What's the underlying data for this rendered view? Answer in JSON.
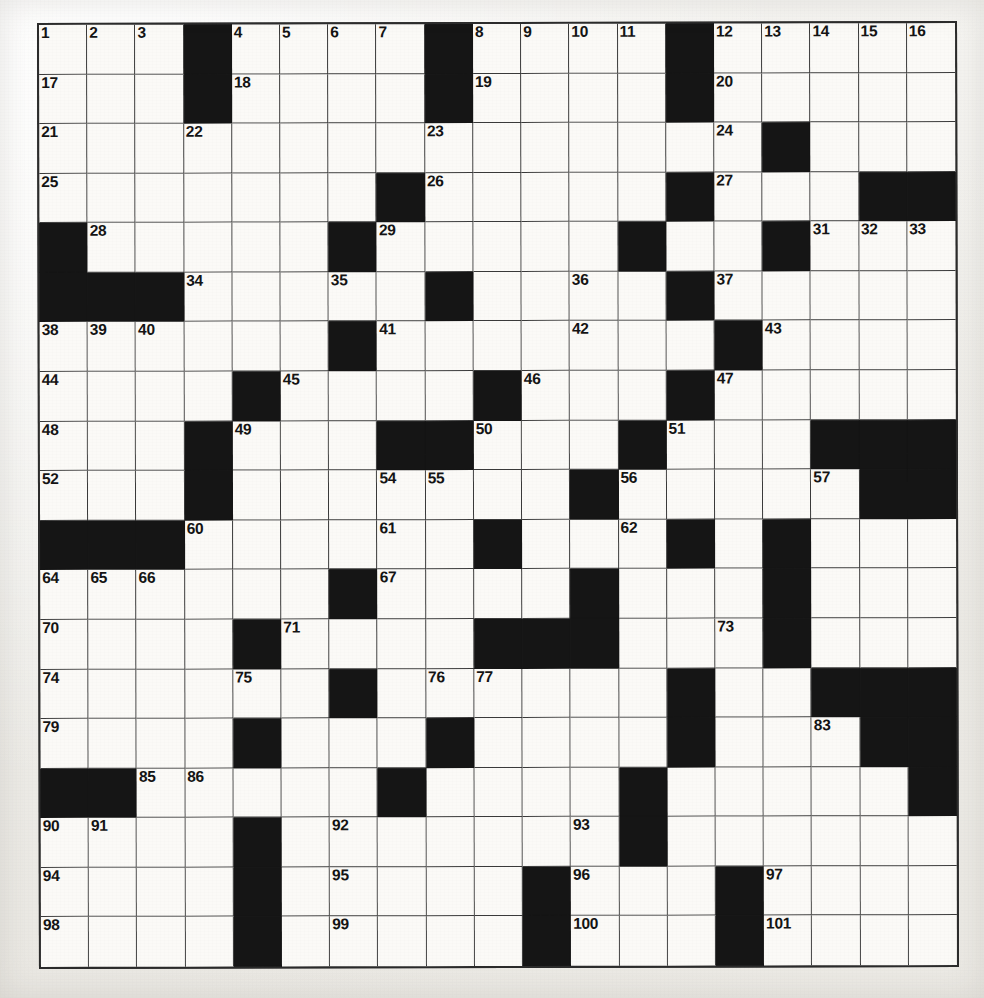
{
  "puzzle": {
    "kind": "crossword-grid",
    "rows": 19,
    "columns": 19,
    "colors": {
      "paper": "#f3f2ef",
      "cell_white": "#fbfaf7",
      "cell_black": "#151515",
      "grid_line": "#3a3a3a",
      "number_text": "#141414"
    },
    "max_clue_number": 101,
    "grid": [
      "...#....#....#.....",
      "...#....#....#.....",
      "...............#...",
      ".......#.....#...##",
      "#.....#.....#..#...",
      "###.....#....#.....",
      "......#.......#....",
      "....#....#...#.....",
      "...#...##...#...###",
      "...#.......#.....##",
      "###......#...#.#...",
      "......#....#...#...",
      "....#....###...#...",
      "......#......#..###",
      "....#...#....#...##",
      "##.....#....#.....#",
      "....#.......#......",
      "....#.....#...#....",
      "....#.....#...#...."
    ],
    "numbers": [
      {
        "r": 0,
        "c": 0,
        "n": "1"
      },
      {
        "r": 0,
        "c": 1,
        "n": "2"
      },
      {
        "r": 0,
        "c": 2,
        "n": "3"
      },
      {
        "r": 0,
        "c": 4,
        "n": "4"
      },
      {
        "r": 0,
        "c": 5,
        "n": "5"
      },
      {
        "r": 0,
        "c": 6,
        "n": "6"
      },
      {
        "r": 0,
        "c": 7,
        "n": "7"
      },
      {
        "r": 0,
        "c": 9,
        "n": "8"
      },
      {
        "r": 0,
        "c": 10,
        "n": "9"
      },
      {
        "r": 0,
        "c": 11,
        "n": "10"
      },
      {
        "r": 0,
        "c": 12,
        "n": "11"
      },
      {
        "r": 0,
        "c": 14,
        "n": "12"
      },
      {
        "r": 0,
        "c": 15,
        "n": "13"
      },
      {
        "r": 0,
        "c": 16,
        "n": "14"
      },
      {
        "r": 0,
        "c": 17,
        "n": "15"
      },
      {
        "r": 0,
        "c": 18,
        "n": "16"
      },
      {
        "r": 1,
        "c": 0,
        "n": "17"
      },
      {
        "r": 1,
        "c": 4,
        "n": "18"
      },
      {
        "r": 1,
        "c": 9,
        "n": "19"
      },
      {
        "r": 1,
        "c": 14,
        "n": "20"
      },
      {
        "r": 2,
        "c": 0,
        "n": "21"
      },
      {
        "r": 2,
        "c": 3,
        "n": "22"
      },
      {
        "r": 2,
        "c": 8,
        "n": "23"
      },
      {
        "r": 2,
        "c": 14,
        "n": "24"
      },
      {
        "r": 3,
        "c": 0,
        "n": "25"
      },
      {
        "r": 3,
        "c": 8,
        "n": "26"
      },
      {
        "r": 3,
        "c": 14,
        "n": "27"
      },
      {
        "r": 4,
        "c": 1,
        "n": "28"
      },
      {
        "r": 4,
        "c": 7,
        "n": "29"
      },
      {
        "r": 4,
        "c": 12,
        "n": "30"
      },
      {
        "r": 4,
        "c": 16,
        "n": "31"
      },
      {
        "r": 4,
        "c": 17,
        "n": "32"
      },
      {
        "r": 4,
        "c": 18,
        "n": "33"
      },
      {
        "r": 5,
        "c": 3,
        "n": "34"
      },
      {
        "r": 5,
        "c": 6,
        "n": "35"
      },
      {
        "r": 5,
        "c": 11,
        "n": "36"
      },
      {
        "r": 5,
        "c": 14,
        "n": "37"
      },
      {
        "r": 6,
        "c": 0,
        "n": "38"
      },
      {
        "r": 6,
        "c": 1,
        "n": "39"
      },
      {
        "r": 6,
        "c": 2,
        "n": "40"
      },
      {
        "r": 6,
        "c": 7,
        "n": "41"
      },
      {
        "r": 6,
        "c": 11,
        "n": "42"
      },
      {
        "r": 6,
        "c": 15,
        "n": "43"
      },
      {
        "r": 7,
        "c": 0,
        "n": "44"
      },
      {
        "r": 7,
        "c": 5,
        "n": "45"
      },
      {
        "r": 7,
        "c": 10,
        "n": "46"
      },
      {
        "r": 7,
        "c": 14,
        "n": "47"
      },
      {
        "r": 8,
        "c": 0,
        "n": "48"
      },
      {
        "r": 8,
        "c": 4,
        "n": "49"
      },
      {
        "r": 8,
        "c": 9,
        "n": "50"
      },
      {
        "r": 8,
        "c": 13,
        "n": "51"
      },
      {
        "r": 9,
        "c": 0,
        "n": "52"
      },
      {
        "r": 9,
        "c": 3,
        "n": "53"
      },
      {
        "r": 9,
        "c": 7,
        "n": "54"
      },
      {
        "r": 9,
        "c": 8,
        "n": "55"
      },
      {
        "r": 9,
        "c": 12,
        "n": "56"
      },
      {
        "r": 9,
        "c": 16,
        "n": "57"
      },
      {
        "r": 9,
        "c": 17,
        "n": "58"
      },
      {
        "r": 9,
        "c": 18,
        "n": "59"
      },
      {
        "r": 10,
        "c": 3,
        "n": "60"
      },
      {
        "r": 10,
        "c": 7,
        "n": "61"
      },
      {
        "r": 10,
        "c": 12,
        "n": "62"
      },
      {
        "r": 10,
        "c": 15,
        "n": "63"
      },
      {
        "r": 11,
        "c": 0,
        "n": "64"
      },
      {
        "r": 11,
        "c": 1,
        "n": "65"
      },
      {
        "r": 11,
        "c": 2,
        "n": "66"
      },
      {
        "r": 11,
        "c": 7,
        "n": "67"
      },
      {
        "r": 11,
        "c": 11,
        "n": "68"
      },
      {
        "r": 11,
        "c": 15,
        "n": "69"
      },
      {
        "r": 12,
        "c": 0,
        "n": "70"
      },
      {
        "r": 12,
        "c": 5,
        "n": "71"
      },
      {
        "r": 12,
        "c": 10,
        "n": "72"
      },
      {
        "r": 12,
        "c": 14,
        "n": "73"
      },
      {
        "r": 13,
        "c": 0,
        "n": "74"
      },
      {
        "r": 13,
        "c": 4,
        "n": "75"
      },
      {
        "r": 13,
        "c": 8,
        "n": "76"
      },
      {
        "r": 13,
        "c": 9,
        "n": "77"
      },
      {
        "r": 13,
        "c": 13,
        "n": "78"
      },
      {
        "r": 14,
        "c": 0,
        "n": "79"
      },
      {
        "r": 14,
        "c": 4,
        "n": "80"
      },
      {
        "r": 14,
        "c": 8,
        "n": "81"
      },
      {
        "r": 14,
        "c": 13,
        "n": "82"
      },
      {
        "r": 14,
        "c": 16,
        "n": "83"
      },
      {
        "r": 14,
        "c": 17,
        "n": "84"
      },
      {
        "r": 15,
        "c": 2,
        "n": "85"
      },
      {
        "r": 15,
        "c": 3,
        "n": "86"
      },
      {
        "r": 15,
        "c": 7,
        "n": "87"
      },
      {
        "r": 15,
        "c": 12,
        "n": "88"
      },
      {
        "r": 15,
        "c": 18,
        "n": "89"
      },
      {
        "r": 16,
        "c": 0,
        "n": "90"
      },
      {
        "r": 16,
        "c": 1,
        "n": "91"
      },
      {
        "r": 16,
        "c": 6,
        "n": "92"
      },
      {
        "r": 16,
        "c": 11,
        "n": "93"
      },
      {
        "r": 17,
        "c": 0,
        "n": "94"
      },
      {
        "r": 17,
        "c": 6,
        "n": "95"
      },
      {
        "r": 17,
        "c": 11,
        "n": "96"
      },
      {
        "r": 17,
        "c": 15,
        "n": "97"
      },
      {
        "r": 18,
        "c": 0,
        "n": "98"
      },
      {
        "r": 18,
        "c": 6,
        "n": "99"
      },
      {
        "r": 18,
        "c": 11,
        "n": "100"
      },
      {
        "r": 18,
        "c": 15,
        "n": "101"
      }
    ]
  }
}
